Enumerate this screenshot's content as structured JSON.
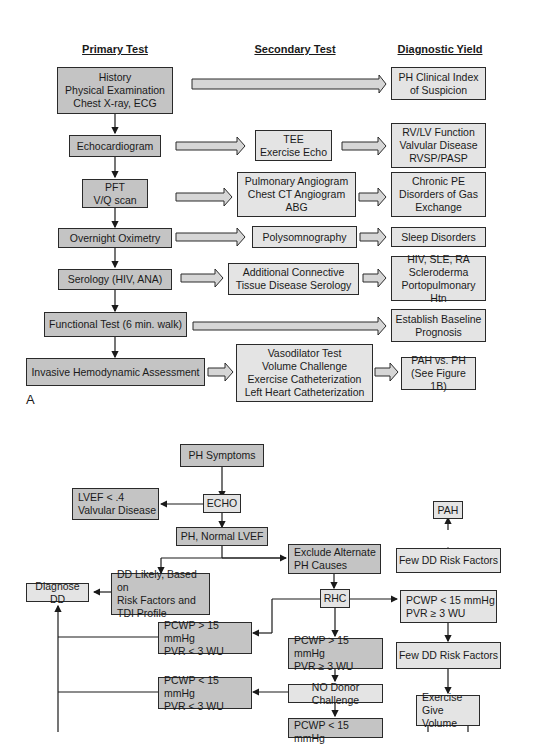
{
  "figureA": {
    "label": "A",
    "headers": {
      "primary": "Primary Test",
      "secondary": "Secondary Test",
      "yield": "Diagnostic Yield"
    },
    "rows": [
      {
        "primary": "History\nPhysical Examination\nChest X-ray, ECG",
        "secondary": "",
        "yield": "PH Clinical Index\nof Suspicion"
      },
      {
        "primary": "Echocardiogram",
        "secondary": "TEE\nExercise Echo",
        "yield": "RV/LV Function\nValvular Disease\nRVSP/PASP"
      },
      {
        "primary": "PFT\nV/Q scan",
        "secondary": "Pulmonary Angiogram\nChest CT Angiogram\nABG",
        "yield": "Chronic PE\nDisorders of Gas\nExchange"
      },
      {
        "primary": "Overnight Oximetry",
        "secondary": "Polysomnography",
        "yield": "Sleep Disorders"
      },
      {
        "primary": "Serology (HIV, ANA)",
        "secondary": "Additional Connective\nTissue Disease Serology",
        "yield": "HIV, SLE, RA\nScleroderma\nPortopulmonary Htn"
      },
      {
        "primary": "Functional Test (6 min. walk)",
        "secondary": "",
        "yield": "Establish Baseline\nPrognosis"
      },
      {
        "primary": "Invasive Hemodynamic Assessment",
        "secondary": "Vasodilator Test\nVolume Challenge\nExercise Catheterization\nLeft Heart Catheterization",
        "yield": "PAH vs. PH\n(See Figure 1B)"
      }
    ]
  },
  "figureB": {
    "nodes": {
      "ph_symptoms": "PH Symptoms",
      "echo": "ECHO",
      "lvef": "LVEF < .4\nValvular Disease",
      "ph_normal_lvef": "PH, Normal LVEF",
      "exclude_alt": "Exclude Alternate\nPH Causes",
      "dd_likely": "DD Likely, Based on\nRisk Factors and\nTDI Profile",
      "diagnose_dd": "Diagnose DD",
      "rhc": "RHC",
      "pcwp_gt_pvr_lt": "PCWP > 15 mmHg\nPVR < 3 WU",
      "pcwp_gt_pvr_ge": "PCWP > 15 mmHg\nPVR ≥ 3 WU",
      "pcwp_lt_pvr_lt": "PCWP < 15 mmHg\nPVR < 3 WU",
      "no_donor": "NO Donor Challenge",
      "pcwp_lt_bottom": "PCWP < 15 mmHg",
      "pah": "PAH",
      "few_dd_1": "Few DD Risk Factors",
      "pcwp_lt_pvr_ge": "PCWP < 15 mmHg\nPVR ≥ 3 WU",
      "few_dd_2": "Few DD Risk Factors",
      "exercise": "Exercise\nGive Volume"
    }
  }
}
